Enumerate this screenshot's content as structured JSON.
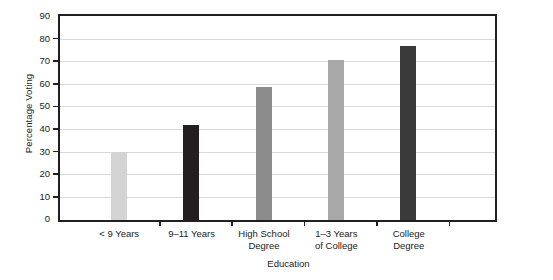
{
  "chart_data": {
    "type": "bar",
    "title": "",
    "xlabel": "Education",
    "ylabel": "Percentage Voting",
    "categories": [
      "< 9 Years",
      "9–11 Years",
      "High School Degree",
      "1–3 Years of College",
      "College Degree"
    ],
    "category_lines": [
      [
        "< 9 Years",
        ""
      ],
      [
        "9–11 Years",
        ""
      ],
      [
        "High School",
        "Degree"
      ],
      [
        "1–3 Years",
        "of College"
      ],
      [
        "College",
        "Degree"
      ]
    ],
    "values": [
      30,
      42,
      59,
      71,
      77
    ],
    "bar_colors": [
      "#d4d4d4",
      "#231f20",
      "#8c8c8c",
      "#a8a8a8",
      "#3a3a3a"
    ],
    "ylim": [
      0,
      90
    ],
    "ytick_step": 10,
    "ytick_labels": [
      "90",
      "80",
      "70",
      "60",
      "50",
      "40",
      "30",
      "20",
      "10",
      "0"
    ],
    "grid": true,
    "legend": "none",
    "axis_color": "#231f20",
    "grid_color": "#d9d9d9"
  }
}
